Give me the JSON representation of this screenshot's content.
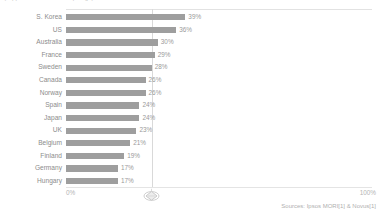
{
  "chart_data": {
    "type": "bar",
    "orientation": "horizontal",
    "title": "(clipped header text at top edge)",
    "xlabel": "",
    "ylabel": "",
    "xlim": [
      0,
      100
    ],
    "grid": false,
    "legend": null,
    "categories": [
      "S. Korea",
      "US",
      "Australia",
      "France",
      "Sweden",
      "Canada",
      "Norway",
      "Spain",
      "Japan",
      "UK",
      "Belgium",
      "Finland",
      "Germany",
      "Hungary"
    ],
    "values": [
      39,
      36,
      30,
      29,
      28,
      26,
      26,
      24,
      24,
      23,
      21,
      19,
      17,
      17
    ],
    "value_labels": [
      "39%",
      "36%",
      "30%",
      "29%",
      "28%",
      "26%",
      "26%",
      "24%",
      "24%",
      "23%",
      "21%",
      "19%",
      "17%",
      "17%"
    ],
    "axis_ticks": [
      "0%",
      "100%"
    ],
    "reference_line_value": 28,
    "bar_color": "#9e9e9e",
    "annotation": "Sources: Ipsos MORI[1] & Novus[1]"
  },
  "axis": {
    "min_label": "0%",
    "max_label": "100%",
    "marker_icon": "diamond-marker-icon"
  },
  "footer": {
    "source": "Sources: Ipsos MORI[1] & Novus[1]"
  }
}
